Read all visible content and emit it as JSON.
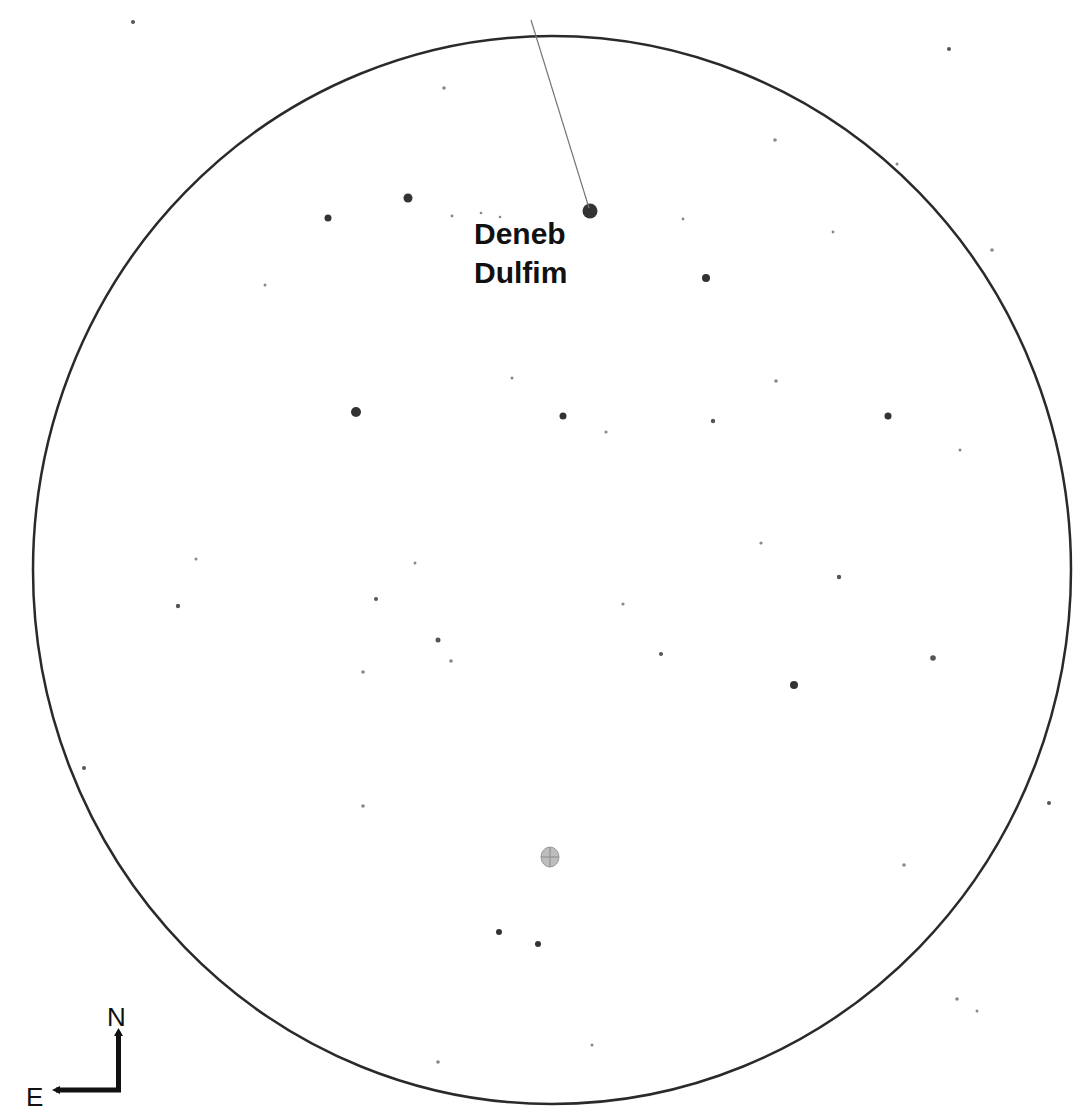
{
  "finder_chart": {
    "field_of_view": {
      "shape": "circle",
      "center": [
        552,
        570
      ],
      "rx": 519,
      "ry": 534,
      "stroke_color": "#2a2a2a"
    },
    "target": {
      "name_line1": "Deneb",
      "name_line2": "Dulfim",
      "star_position": [
        590,
        211
      ],
      "pointer_line": {
        "from": [
          531,
          20
        ],
        "to": [
          589,
          208
        ]
      }
    },
    "object_marker": {
      "type": "deep-sky-object",
      "position": [
        550,
        857
      ],
      "color": "#9a9a9a"
    },
    "compass": {
      "north_label": "N",
      "east_label": "E"
    },
    "stars": [
      {
        "x": 590,
        "y": 211,
        "r": 7.5
      },
      {
        "x": 408,
        "y": 198,
        "r": 4.5
      },
      {
        "x": 328,
        "y": 218,
        "r": 3.5
      },
      {
        "x": 706,
        "y": 278,
        "r": 4
      },
      {
        "x": 356,
        "y": 412,
        "r": 5
      },
      {
        "x": 563,
        "y": 416,
        "r": 3.5
      },
      {
        "x": 888,
        "y": 416,
        "r": 3.5
      },
      {
        "x": 713,
        "y": 421,
        "r": 2.2
      },
      {
        "x": 794,
        "y": 685,
        "r": 4
      },
      {
        "x": 933,
        "y": 658,
        "r": 2.8
      },
      {
        "x": 499,
        "y": 932,
        "r": 3
      },
      {
        "x": 538,
        "y": 944,
        "r": 3
      },
      {
        "x": 178,
        "y": 606,
        "r": 2.2
      },
      {
        "x": 376,
        "y": 599,
        "r": 2
      },
      {
        "x": 438,
        "y": 640,
        "r": 2.5
      },
      {
        "x": 661,
        "y": 654,
        "r": 2
      },
      {
        "x": 839,
        "y": 577,
        "r": 2.2
      },
      {
        "x": 363,
        "y": 672,
        "r": 1.8
      },
      {
        "x": 451,
        "y": 661,
        "r": 1.8
      },
      {
        "x": 623,
        "y": 604,
        "r": 1.6
      },
      {
        "x": 761,
        "y": 543,
        "r": 1.6
      },
      {
        "x": 415,
        "y": 563,
        "r": 1.5
      },
      {
        "x": 196,
        "y": 559,
        "r": 1.5
      },
      {
        "x": 133,
        "y": 22,
        "r": 2
      },
      {
        "x": 949,
        "y": 49,
        "r": 2
      },
      {
        "x": 444,
        "y": 88,
        "r": 1.8
      },
      {
        "x": 775,
        "y": 140,
        "r": 1.8
      },
      {
        "x": 897,
        "y": 164,
        "r": 1.5
      },
      {
        "x": 992,
        "y": 250,
        "r": 1.8
      },
      {
        "x": 776,
        "y": 381,
        "r": 1.8
      },
      {
        "x": 606,
        "y": 432,
        "r": 1.6
      },
      {
        "x": 960,
        "y": 450,
        "r": 1.5
      },
      {
        "x": 84,
        "y": 768,
        "r": 2
      },
      {
        "x": 363,
        "y": 806,
        "r": 1.8
      },
      {
        "x": 904,
        "y": 865,
        "r": 1.8
      },
      {
        "x": 1049,
        "y": 803,
        "r": 2
      },
      {
        "x": 957,
        "y": 999,
        "r": 1.8
      },
      {
        "x": 438,
        "y": 1062,
        "r": 1.8
      },
      {
        "x": 592,
        "y": 1045,
        "r": 1.5
      },
      {
        "x": 977,
        "y": 1011,
        "r": 1.5
      },
      {
        "x": 265,
        "y": 285,
        "r": 1.5
      },
      {
        "x": 512,
        "y": 378,
        "r": 1.5
      },
      {
        "x": 833,
        "y": 232,
        "r": 1.4
      },
      {
        "x": 683,
        "y": 219,
        "r": 1.4
      },
      {
        "x": 452,
        "y": 216,
        "r": 1.4
      },
      {
        "x": 481,
        "y": 213,
        "r": 1.3
      },
      {
        "x": 500,
        "y": 217,
        "r": 1.3
      }
    ]
  }
}
